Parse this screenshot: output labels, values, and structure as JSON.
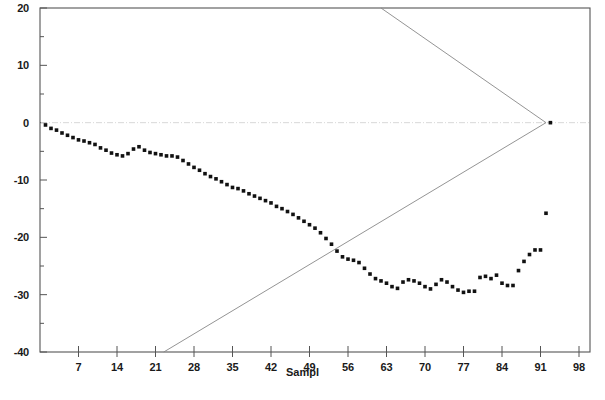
{
  "chart_data": {
    "type": "scatter",
    "title": "",
    "xlabel": "Sampl",
    "ylabel": "",
    "xlim": [
      0,
      100
    ],
    "ylim": [
      -40,
      20
    ],
    "grid": false,
    "legend": null,
    "x_ticks": [
      7,
      14,
      21,
      28,
      35,
      42,
      49,
      56,
      63,
      70,
      77,
      84,
      91,
      98
    ],
    "y_ticks": [
      20,
      10,
      0,
      -10,
      -20,
      -30,
      -40
    ],
    "y_minor_ticks": [
      15,
      5,
      -5,
      -15,
      -25,
      -35
    ],
    "reference_line": {
      "label": "zero",
      "value": 0,
      "style": "dash-dot",
      "color": "#d8d8d8"
    },
    "series": [
      {
        "name": "observations",
        "marker": "filled-square",
        "color": "#111111",
        "points": [
          [
            1,
            -0.4
          ],
          [
            2,
            -1.0
          ],
          [
            3,
            -1.3
          ],
          [
            4,
            -1.8
          ],
          [
            5,
            -2.2
          ],
          [
            6,
            -2.6
          ],
          [
            7,
            -3.0
          ],
          [
            8,
            -3.2
          ],
          [
            9,
            -3.5
          ],
          [
            10,
            -3.8
          ],
          [
            11,
            -4.4
          ],
          [
            12,
            -4.8
          ],
          [
            13,
            -5.3
          ],
          [
            14,
            -5.6
          ],
          [
            15,
            -5.8
          ],
          [
            16,
            -5.4
          ],
          [
            17,
            -4.6
          ],
          [
            18,
            -4.2
          ],
          [
            19,
            -4.8
          ],
          [
            20,
            -5.2
          ],
          [
            21,
            -5.4
          ],
          [
            22,
            -5.6
          ],
          [
            23,
            -5.8
          ],
          [
            24,
            -5.8
          ],
          [
            25,
            -6.0
          ],
          [
            26,
            -6.6
          ],
          [
            27,
            -7.2
          ],
          [
            28,
            -7.8
          ],
          [
            29,
            -8.3
          ],
          [
            30,
            -8.9
          ],
          [
            31,
            -9.4
          ],
          [
            32,
            -9.8
          ],
          [
            33,
            -10.3
          ],
          [
            34,
            -10.8
          ],
          [
            35,
            -11.3
          ],
          [
            36,
            -11.5
          ],
          [
            37,
            -11.9
          ],
          [
            38,
            -12.4
          ],
          [
            39,
            -12.8
          ],
          [
            40,
            -13.2
          ],
          [
            41,
            -13.6
          ],
          [
            42,
            -14.0
          ],
          [
            43,
            -14.6
          ],
          [
            44,
            -15.0
          ],
          [
            45,
            -15.5
          ],
          [
            46,
            -16.0
          ],
          [
            47,
            -16.6
          ],
          [
            48,
            -17.2
          ],
          [
            49,
            -17.8
          ],
          [
            50,
            -18.4
          ],
          [
            51,
            -19.2
          ],
          [
            52,
            -20.2
          ],
          [
            53,
            -21.2
          ],
          [
            54,
            -22.4
          ],
          [
            55,
            -23.4
          ],
          [
            56,
            -23.8
          ],
          [
            57,
            -24.0
          ],
          [
            58,
            -24.4
          ],
          [
            59,
            -25.4
          ],
          [
            60,
            -26.4
          ],
          [
            61,
            -27.2
          ],
          [
            62,
            -27.6
          ],
          [
            63,
            -28.0
          ],
          [
            64,
            -28.6
          ],
          [
            65,
            -28.9
          ],
          [
            66,
            -27.8
          ],
          [
            67,
            -27.4
          ],
          [
            68,
            -27.6
          ],
          [
            69,
            -28.0
          ],
          [
            70,
            -28.6
          ],
          [
            71,
            -29.0
          ],
          [
            72,
            -28.2
          ],
          [
            73,
            -27.4
          ],
          [
            74,
            -27.8
          ],
          [
            75,
            -28.6
          ],
          [
            76,
            -29.2
          ],
          [
            77,
            -29.6
          ],
          [
            78,
            -29.4
          ],
          [
            79,
            -29.4
          ],
          [
            80,
            -27.0
          ],
          [
            81,
            -26.8
          ],
          [
            82,
            -27.2
          ],
          [
            83,
            -26.6
          ],
          [
            84,
            -28.0
          ],
          [
            85,
            -28.4
          ],
          [
            86,
            -28.4
          ],
          [
            87,
            -25.8
          ],
          [
            88,
            -24.2
          ],
          [
            89,
            -23.0
          ],
          [
            90,
            -22.2
          ],
          [
            91,
            -22.2
          ],
          [
            92,
            -15.8
          ],
          [
            92.8,
            0.0
          ]
        ]
      }
    ],
    "limit_lines": [
      {
        "name": "upper-control-limit",
        "color": "#888888",
        "from": [
          62.0,
          20.0
        ],
        "to": [
          92.0,
          0.0
        ]
      },
      {
        "name": "lower-control-limit",
        "color": "#888888",
        "from": [
          22.5,
          -40.0
        ],
        "to": [
          92.0,
          0.0
        ]
      }
    ]
  },
  "axes": {
    "x_title": "Sampl",
    "x_tick_labels": [
      "7",
      "14",
      "21",
      "28",
      "35",
      "42",
      "49",
      "56",
      "63",
      "70",
      "77",
      "84",
      "91",
      "98"
    ],
    "y_tick_labels": [
      "20",
      "10",
      "0",
      "-10",
      "-20",
      "-30",
      "-40"
    ]
  }
}
